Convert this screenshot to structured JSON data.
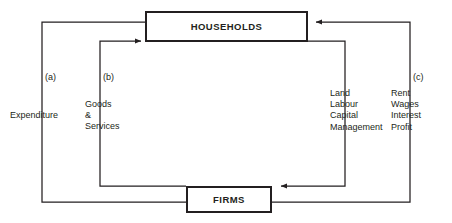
{
  "diagram": {
    "type": "circular-flow",
    "line_color": "#231f20",
    "background": "#ffffff",
    "boxes": [
      {
        "id": "households",
        "label": "HOUSEHOLDS"
      },
      {
        "id": "firms",
        "label": "FIRMS"
      }
    ],
    "tags": {
      "a": "(a)",
      "b": "(b)",
      "c": "(c)"
    },
    "flows": [
      {
        "tag": "(a)",
        "label": "Expenditure",
        "from": "households",
        "to": "firms",
        "side": "left-outer"
      },
      {
        "tag": "(b)",
        "label_lines": [
          "Goods",
          "&",
          "Services"
        ],
        "from": "firms",
        "to": "households",
        "side": "left-inner"
      },
      {
        "tag": "",
        "label_lines": [
          "Land",
          "Labour",
          "Capital",
          "Management"
        ],
        "from": "households",
        "to": "firms",
        "side": "right-inner"
      },
      {
        "tag": "(c)",
        "label_lines": [
          "Rent",
          "Wages",
          "Interest",
          "Profit"
        ],
        "from": "firms",
        "to": "households",
        "side": "right-outer"
      }
    ],
    "labels": {
      "expenditure": "Expenditure",
      "goods_line1": "Goods",
      "goods_line2": "&",
      "goods_line3": "Services",
      "factors_line1": "Land",
      "factors_line2": "Labour",
      "factors_line3": "Capital",
      "factors_line4": "Management",
      "payments_line1": "Rent",
      "payments_line2": "Wages",
      "payments_line3": "Interest",
      "payments_line4": "Profit"
    }
  }
}
